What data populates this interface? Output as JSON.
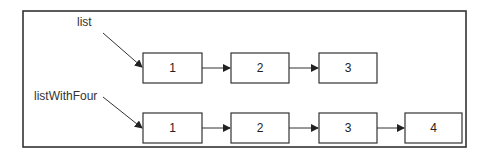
{
  "diagram": {
    "type": "linked-list",
    "lists": [
      {
        "label": "list",
        "nodes": [
          {
            "value": "1"
          },
          {
            "value": "2"
          },
          {
            "value": "3"
          }
        ]
      },
      {
        "label": "listWithFour",
        "nodes": [
          {
            "value": "1"
          },
          {
            "value": "2"
          },
          {
            "value": "3"
          },
          {
            "value": "4"
          }
        ]
      }
    ],
    "colors": {
      "stroke": "#333333",
      "text": "#222222",
      "background": "#ffffff"
    }
  }
}
